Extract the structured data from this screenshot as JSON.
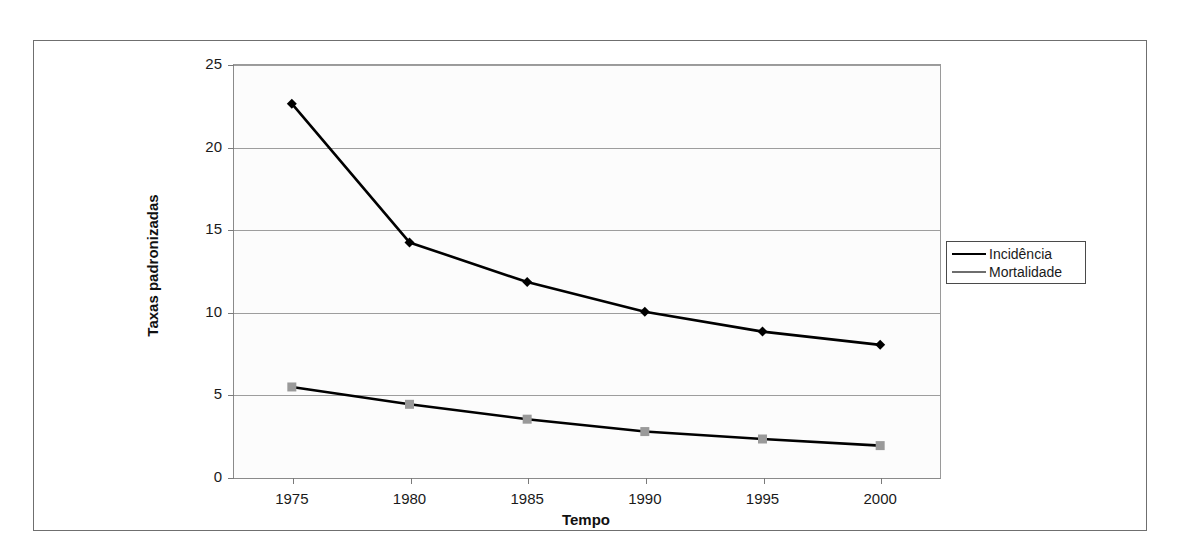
{
  "chart_data": {
    "type": "line",
    "title": "",
    "xlabel": "Tempo",
    "ylabel": "Taxas padronizadas",
    "x": [
      1975,
      1980,
      1985,
      1990,
      1995,
      2000
    ],
    "xtick_labels": [
      "1975",
      "1980",
      "1985",
      "1990",
      "1995",
      "2000"
    ],
    "ytick_labels": [
      "0",
      "5",
      "10",
      "15",
      "20",
      "25"
    ],
    "yticks": [
      0,
      5,
      10,
      15,
      20,
      25
    ],
    "ylim": [
      0,
      25
    ],
    "xlim": [
      1972.5,
      2002.5
    ],
    "grid": "horizontal",
    "legend_position": "right",
    "series": [
      {
        "name": "Incidência",
        "values": [
          22.6,
          14.2,
          11.8,
          10.0,
          8.8,
          8.0
        ],
        "color": "#000000",
        "marker": "diamond",
        "marker_color": "#000000"
      },
      {
        "name": "Mortalidade",
        "values": [
          5.45,
          4.4,
          3.5,
          2.75,
          2.3,
          1.9
        ],
        "color": "#000000",
        "marker": "square",
        "marker_color": "#9a9a9a"
      }
    ]
  },
  "legend": {
    "items": [
      {
        "label": "Incidência",
        "marker": "diamond-icon"
      },
      {
        "label": "Mortalidade",
        "marker": "square-icon"
      }
    ]
  },
  "colors": {
    "plot_background": "#fcfcfc",
    "gridline": "#9d9d9d",
    "axis": "#8a8a8a",
    "frame": "#6f6f6f",
    "text": "#1a1a1a",
    "incidence_series": "#000000",
    "mortality_marker": "#9a9a9a"
  }
}
